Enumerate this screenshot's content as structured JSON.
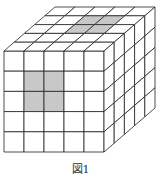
{
  "figure": {
    "type": "cube-grid",
    "divisions": 5,
    "caption": "図1",
    "shaded_color": "#c8c8c8",
    "line_color": "#222222",
    "faces": {
      "top": {
        "shaded": [
          [
            2,
            1
          ],
          [
            3,
            1
          ],
          [
            2,
            2
          ],
          [
            3,
            2
          ]
        ]
      },
      "front": {
        "shaded": [
          [
            1,
            1
          ],
          [
            2,
            1
          ],
          [
            1,
            2
          ],
          [
            2,
            2
          ]
        ]
      },
      "right": {
        "shaded": []
      }
    }
  }
}
